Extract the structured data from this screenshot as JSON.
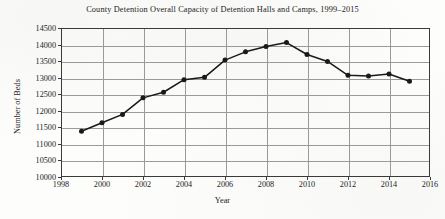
{
  "chart_data": {
    "type": "line",
    "title": "County Detention Overall Capacity of Detention Halls and Camps, 1999–2015",
    "xlabel": "Year",
    "ylabel": "Number of Beds",
    "x": [
      1999,
      2000,
      2001,
      2002,
      2003,
      2004,
      2005,
      2006,
      2007,
      2008,
      2009,
      2010,
      2011,
      2012,
      2013,
      2014,
      2015
    ],
    "values": [
      11380,
      11640,
      11890,
      12390,
      12560,
      12940,
      13010,
      13530,
      13780,
      13940,
      14060,
      13700,
      13490,
      13070,
      13050,
      13110,
      12890
    ],
    "series": [
      {
        "name": "Number of Beds",
        "values": [
          11380,
          11640,
          11890,
          12390,
          12560,
          12940,
          13010,
          13530,
          13780,
          13940,
          14060,
          13700,
          13490,
          13070,
          13050,
          13110,
          12890
        ]
      }
    ],
    "xlim": [
      1998,
      2016
    ],
    "ylim": [
      10000,
      14500
    ],
    "x_ticks": [
      1998,
      2000,
      2002,
      2004,
      2006,
      2008,
      2010,
      2012,
      2014,
      2016
    ],
    "x_tick_labels": [
      "1998",
      "2000",
      "2002",
      "2004",
      "2006",
      "2008",
      "2010",
      "2012",
      "2014",
      "2016"
    ],
    "y_ticks": [
      10000,
      10500,
      11000,
      11500,
      12000,
      12500,
      13000,
      13500,
      14000,
      14500
    ],
    "y_tick_labels": [
      "10000",
      "10500",
      "11000",
      "11500",
      "12000",
      "12500",
      "13000",
      "13500",
      "14000",
      "14500"
    ],
    "grid": true,
    "grid_axes": "both",
    "legend": false,
    "legend_position": "none",
    "marker": "circle",
    "line_color": "#1a1a1a",
    "marker_color": "#1a1a1a",
    "grid_color": "#9a9a9a",
    "axis_color": "#3a3a3a",
    "background_color": "#fdfdfc"
  }
}
